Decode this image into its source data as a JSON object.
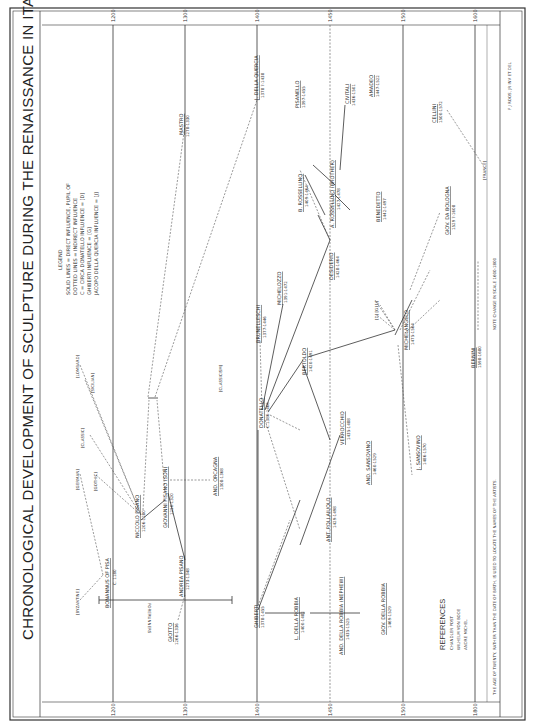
{
  "title": "CHRONOLOGICAL DEVELOPMENT OF SCULPTURE DURING THE RENAISSANCE IN ITALY",
  "legend": {
    "heading": "LEGEND",
    "lines": [
      "SOLID LINES = DIRECT INFLUENCE, PUPIL OF",
      "DOTTED LINES = INDIRECT INFLUENCE",
      "C = CIRCA     DONATELLO INFLUENCE = [D]",
      "GHIBERTI INFLUENCE = [G]",
      "JACOPO DELLA QUERCIA INFLUENCE = [J]"
    ]
  },
  "years": [
    "1200",
    "1300",
    "1400",
    "1450",
    "1500",
    "1600"
  ],
  "footer": {
    "note_age": "THE AGE OF TWENTY, RATHER THAN THE DATE OF BIRTH, IS USED TO LOCATE THE NAMES OF THE ARTISTS.",
    "note_scale": "NOTE   CHANGE IN SCALE  1600-1800",
    "credit": "F J ROOS, JR  INV ET DEL",
    "year_1800": "1800"
  },
  "references": {
    "heading": "REFERENCES",
    "items": [
      "CHANDLER POST",
      "WILHELM VON BODE",
      "ANDRE MICHEL"
    ]
  },
  "forerunners": "FORERUNNERS",
  "influences": {
    "byzantine": "[BYZANTINE]",
    "german": "[GERMAN]",
    "gothic": "[GOTHIC]",
    "classic": "[CLASSIC]",
    "lombard": "[LOMBARD]",
    "sicilian": "[SICILIAN]",
    "classicism": "[CLASSICISM]",
    "france": "[FRANCE]",
    "dgj": "[D] [G] [J]"
  },
  "artists": {
    "bonannus": {
      "name": "BONANNUS OF PISA",
      "dates": "C. 1180"
    },
    "niccolo": {
      "name": "NICCOLO PISANO",
      "dates": "1206-1280"
    },
    "giovanni": {
      "name": "GIOVANNI PISANO (SON)",
      "dates": "1250-1320"
    },
    "andrea": {
      "name": "ANDREA PISANO",
      "dates": "1273-1348"
    },
    "giotto": {
      "name": "GIOTTO",
      "dates": "1266-1336"
    },
    "orcagna": {
      "name": "AND. ORCAGNA",
      "dates": "1308-1368"
    },
    "mastro": {
      "name": "MASTRO",
      "dates": "1278-1330"
    },
    "quercia": {
      "name": "J. DELLA QUERCIA",
      "dates": "1378 ?-1438"
    },
    "ghiberti": {
      "name": "GHIBERTI",
      "dates": "1378-1455"
    },
    "l_robbia": {
      "name": "L. DELLA ROBBIA",
      "dates": "1400-1482"
    },
    "and_robbia": {
      "name": "AND. DELLA ROBBIA (NEPHEW)",
      "dates": "1435-1525"
    },
    "giov_robbia": {
      "name": "GIOV. DELLA ROBBIA",
      "dates": "1469-1529"
    },
    "donatello": {
      "name": "DONATELLO",
      "dates": "C.1386-1466"
    },
    "brunelleschi": {
      "name": "BRUNELLESCHI",
      "dates": "1377-1446"
    },
    "michelozzo": {
      "name": "MICHELOZZO",
      "dates": "1391-1472"
    },
    "bertoldo": {
      "name": "BERTOLDO",
      "dates": "1420-1491"
    },
    "pollaiuolo": {
      "name": "ANT. POLLAIUOLO",
      "dates": "1429-1498"
    },
    "verrocchio": {
      "name": "VERROCCHIO",
      "dates": "1435-1488"
    },
    "sansovino_and": {
      "name": "AND. SANSOVINO",
      "dates": "1460-1529"
    },
    "desiderio": {
      "name": "DESIDERIO",
      "dates": "1428-1464"
    },
    "b_rossellino": {
      "name": "B. ROSSELLINO",
      "dates": "1409-1464"
    },
    "a_rossellino": {
      "name": "A. ROSSELLINO (BROTHER)",
      "dates": "1427-1478"
    },
    "pisanello": {
      "name": "PISANELLO",
      "dates": "1397-1455"
    },
    "civitali": {
      "name": "CIVITALI",
      "dates": "1436-1501"
    },
    "amadeo": {
      "name": "AMADEO",
      "dates": "1447-1522"
    },
    "benedetto": {
      "name": "BENEDETTO",
      "dates": "1442-1497"
    },
    "michelangelo": {
      "name": "MICHELANGELO",
      "dates": "1475-1564"
    },
    "j_sansovino": {
      "name": "J. SANSOVINO",
      "dates": "1486-1570"
    },
    "giov_bologna": {
      "name": "GIOV. DA BOLOGNA",
      "dates": "1529 ?-1608"
    },
    "cellini": {
      "name": "CELLINI",
      "dates": "1500-1572"
    },
    "bernini": {
      "name": "BERNINI",
      "dates": "1598-1680"
    }
  }
}
